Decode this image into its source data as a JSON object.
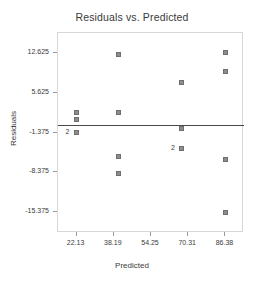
{
  "chart_data": {
    "type": "scatter",
    "title": "Residuals vs. Predicted",
    "xlabel": "Predicted",
    "ylabel": "Residuals",
    "xlim": [
      14.1,
      94.4
    ],
    "ylim": [
      -19.0,
      16.1
    ],
    "xticks": [
      22.13,
      38.19,
      54.25,
      70.31,
      86.38
    ],
    "xtick_labels": [
      "22.13",
      "38.19",
      "54.25",
      "70.31",
      "86.38"
    ],
    "yticks": [
      12.625,
      5.625,
      -1.375,
      -8.375,
      -15.375
    ],
    "ytick_labels": [
      "12.625",
      "5.625",
      "-1.375",
      "-8.375",
      "-15.375"
    ],
    "grid": false,
    "legend": null,
    "reference_line": {
      "orientation": "horizontal",
      "y": 0.0,
      "color": "#4a4a4a"
    },
    "marker": {
      "shape": "square",
      "color": "#8c8c8c",
      "edge_color": "#6f6f6f",
      "size": 5
    },
    "points": [
      {
        "x": 22.13,
        "y": 2.2,
        "count": 1,
        "label": ""
      },
      {
        "x": 22.13,
        "y": 0.9,
        "count": 1,
        "label": ""
      },
      {
        "x": 22.13,
        "y": -1.375,
        "count": 2,
        "label": "2"
      },
      {
        "x": 40.2,
        "y": 12.3,
        "count": 1,
        "label": ""
      },
      {
        "x": 40.2,
        "y": 2.2,
        "count": 1,
        "label": ""
      },
      {
        "x": 40.2,
        "y": -5.6,
        "count": 1,
        "label": ""
      },
      {
        "x": 40.2,
        "y": -8.6,
        "count": 1,
        "label": ""
      },
      {
        "x": 67.6,
        "y": 7.4,
        "count": 1,
        "label": ""
      },
      {
        "x": 67.6,
        "y": -0.7,
        "count": 1,
        "label": ""
      },
      {
        "x": 67.6,
        "y": -4.2,
        "count": 2,
        "label": "2"
      },
      {
        "x": 86.38,
        "y": 12.625,
        "count": 1,
        "label": ""
      },
      {
        "x": 86.38,
        "y": 9.4,
        "count": 1,
        "label": ""
      },
      {
        "x": 86.38,
        "y": -6.1,
        "count": 1,
        "label": ""
      },
      {
        "x": 86.38,
        "y": -15.375,
        "count": 1,
        "label": ""
      }
    ]
  }
}
